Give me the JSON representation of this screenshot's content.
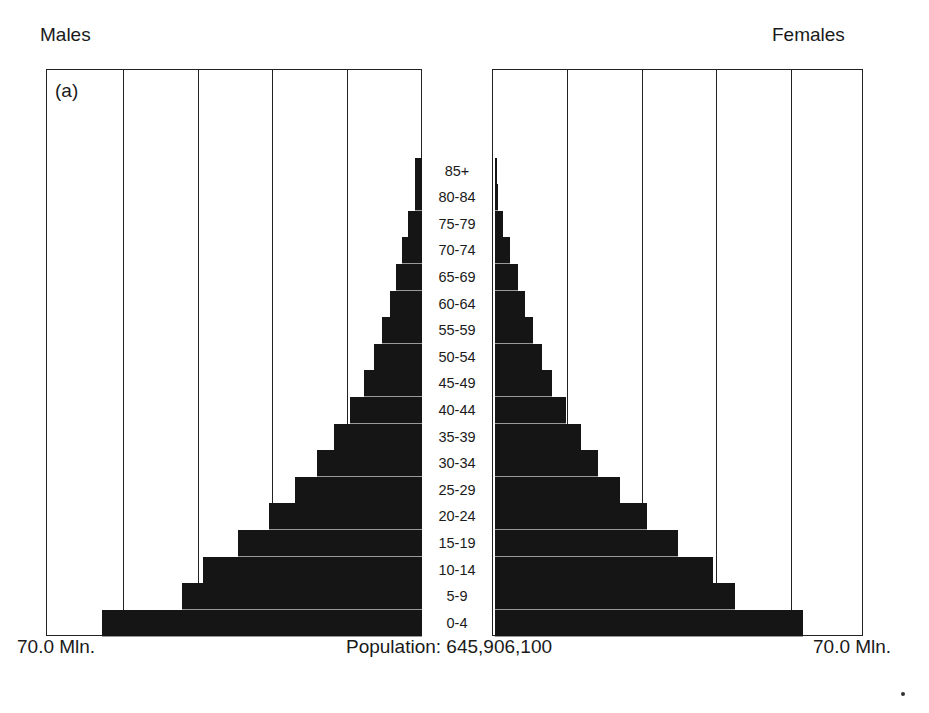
{
  "chart_data": {
    "type": "bar",
    "subtype": "population-pyramid",
    "panel_tag": "(a)",
    "left_title": "Males",
    "right_title": "Females",
    "xlim_mln": [
      0,
      70
    ],
    "axis_label_left": "70.0 Mln.",
    "axis_label_right": "70.0 Mln.",
    "total_label": "Population: 645,906,100",
    "gridlines_mln": [
      14,
      28,
      42,
      56
    ],
    "categories": [
      "85+",
      "80-84",
      "75-79",
      "70-74",
      "65-69",
      "60-64",
      "55-59",
      "50-54",
      "45-49",
      "40-44",
      "35-39",
      "30-34",
      "25-29",
      "20-24",
      "15-19",
      "10-14",
      "5-9",
      "0-4"
    ],
    "series": [
      {
        "name": "Males",
        "unit": "million",
        "values": [
          1.3,
          1.3,
          2.6,
          3.8,
          4.9,
          6.0,
          7.5,
          9.0,
          10.9,
          13.5,
          16.6,
          19.8,
          23.9,
          28.8,
          34.7,
          41.2,
          45.2,
          60.2
        ]
      },
      {
        "name": "Females",
        "unit": "million",
        "values": [
          0.4,
          0.6,
          1.5,
          2.8,
          4.3,
          5.6,
          7.1,
          8.8,
          10.7,
          13.3,
          16.2,
          19.4,
          23.5,
          28.6,
          34.5,
          41.1,
          45.2,
          58.0
        ]
      }
    ],
    "bar_color": "#151515",
    "grid": true
  },
  "labels": {
    "males": "Males",
    "females": "Females",
    "panel_tag": "(a)",
    "axis_left": "70.0 Mln.",
    "axis_right": "70.0 Mln.",
    "total": "Population: 645,906,100"
  }
}
